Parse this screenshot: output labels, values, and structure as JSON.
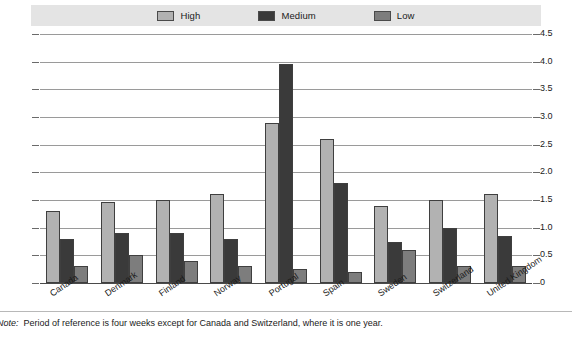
{
  "legend": {
    "items": [
      {
        "label": "High",
        "color": "#b2b2b2"
      },
      {
        "label": "Medium",
        "color": "#3a3a3a"
      },
      {
        "label": "Low",
        "color": "#7d7d7d"
      }
    ]
  },
  "footnote": {
    "label": "Note:",
    "text": "Period of reference is four weeks except for Canada and Switzerland, where it is one year."
  },
  "chart_data": {
    "type": "bar",
    "title": "",
    "subtitle": "",
    "xlabel": "",
    "ylabel": "",
    "ylim": [
      0,
      4.5
    ],
    "yticks": [
      "0",
      "0.5",
      "1.0",
      "1.5",
      "2.0",
      "2.5",
      "3.0",
      "3.5",
      "4.0",
      "4.5"
    ],
    "ytick_values": [
      0,
      0.5,
      1.0,
      1.5,
      2.0,
      2.5,
      3.0,
      3.5,
      4.0,
      4.5
    ],
    "grid": true,
    "dual_axis": true,
    "legend_position": "top",
    "categories": [
      "Canada",
      "Denmark",
      "Finland",
      "Norway",
      "Portugal",
      "Spain",
      "Sweden",
      "Switzerland",
      "United Kingdom"
    ],
    "series": [
      {
        "name": "High",
        "color": "#b2b2b2",
        "values": [
          1.3,
          1.47,
          1.5,
          1.6,
          2.9,
          2.6,
          1.4,
          1.5,
          1.6
        ]
      },
      {
        "name": "Medium",
        "color": "#3a3a3a",
        "values": [
          0.8,
          0.9,
          0.9,
          0.8,
          3.95,
          1.8,
          0.75,
          1.0,
          0.85
        ]
      },
      {
        "name": "Low",
        "color": "#7d7d7d",
        "values": [
          0.3,
          0.5,
          0.4,
          0.3,
          0.25,
          0.2,
          0.6,
          0.3,
          0.3
        ]
      }
    ]
  }
}
